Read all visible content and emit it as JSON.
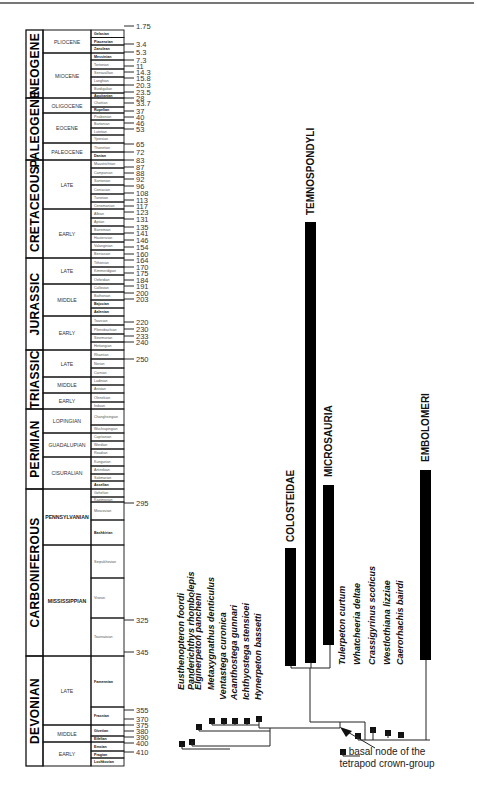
{
  "figure": {
    "timescale": {
      "systems": [
        {
          "name": "NEOGENE",
          "series": [
            {
              "name": "PLIOCENE",
              "stages": [
                "Gelasian",
                "Piacenzian",
                "Zanclean"
              ]
            },
            {
              "name": "MIOCENE",
              "stages": [
                "Messinian",
                "Tortonian",
                "Serravallian",
                "Langhian",
                "Burdigalian",
                "Aquitanian"
              ]
            }
          ]
        },
        {
          "name": "PALEOGENE",
          "series": [
            {
              "name": "OLIGOCENE",
              "stages": [
                "Chattian",
                "Rupelian"
              ]
            },
            {
              "name": "EOCENE",
              "stages": [
                "Priabonian",
                "Bartonian",
                "Lutetian",
                "Ypresian"
              ]
            },
            {
              "name": "PALEOCENE",
              "stages": [
                "Thanetian",
                "Danian"
              ]
            }
          ]
        },
        {
          "name": "CRETACEOUS",
          "series": [
            {
              "name": "LATE",
              "stages": [
                "Maastrichtian",
                "Campanian",
                "Santonian",
                "Coniacian",
                "Turonian",
                "Cenomanian"
              ]
            },
            {
              "name": "EARLY",
              "stages": [
                "Albian",
                "Aptian",
                "Barremian",
                "Hauterivian",
                "Valanginian",
                "Berriasian"
              ]
            }
          ]
        },
        {
          "name": "JURASSIC",
          "series": [
            {
              "name": "LATE",
              "stages": [
                "Tithonian",
                "Kimmeridgian",
                "Oxfordian"
              ]
            },
            {
              "name": "MIDDLE",
              "stages": [
                "Callovian",
                "Bathonian",
                "Bajocian",
                "Aalenian"
              ]
            },
            {
              "name": "EARLY",
              "stages": [
                "Toarcian",
                "Pliensbachian",
                "Sinemurian",
                "Hettangian"
              ]
            }
          ]
        },
        {
          "name": "TRIASSIC",
          "series": [
            {
              "name": "LATE",
              "stages": [
                "Rhaetian",
                "Norian",
                "Carnian"
              ]
            },
            {
              "name": "MIDDLE",
              "stages": [
                "Ladinian",
                "Anisian"
              ]
            },
            {
              "name": "EARLY",
              "stages": [
                "Olenekian",
                "Induan"
              ]
            }
          ]
        },
        {
          "name": "PERMIAN",
          "series": [
            {
              "name": "LOPINGIAN",
              "stages": [
                "Changhsingian",
                "Wuchiapingian"
              ]
            },
            {
              "name": "GUADALUPIAN",
              "stages": [
                "Capitanian",
                "Wordian",
                "Roadian"
              ]
            },
            {
              "name": "CISURALIAN",
              "stages": [
                "Kungurian",
                "Artinskian",
                "Sakmarian",
                "Asselian"
              ]
            }
          ]
        },
        {
          "name": "CARBONIFEROUS",
          "series": [
            {
              "name": "PENNSYLVANIAN",
              "stages": [
                "Gzhelian",
                "Kazimovian",
                "Moscovian",
                "Bashkirian"
              ]
            },
            {
              "name": "MISSISSIPPIAN",
              "stages": [
                "Serpukhovian",
                "Visean",
                "Tournaisian"
              ]
            }
          ]
        },
        {
          "name": "DEVONIAN",
          "series": [
            {
              "name": "LATE",
              "stages": [
                "Famennian",
                "Frasnian"
              ]
            },
            {
              "name": "MIDDLE",
              "stages": [
                "Givetian",
                "Eifelian"
              ]
            },
            {
              "name": "EARLY",
              "stages": [
                "Emsian",
                "Pragian",
                "Lochkovian"
              ]
            }
          ]
        }
      ],
      "ages_ma": [
        "1.75",
        "3.4",
        "5.3",
        "7.3",
        "11",
        "14.3",
        "15.8",
        "20.3",
        "23.5",
        "28",
        "33.7",
        "37",
        "40",
        "46",
        "53",
        "65",
        "72",
        "83",
        "87",
        "88",
        "92",
        "96",
        "108",
        "113",
        "117",
        "123",
        "131",
        "135",
        "141",
        "146",
        "154",
        "160",
        "164",
        "170",
        "175",
        "184",
        "191",
        "200",
        "203",
        "220",
        "230",
        "233",
        "240",
        "250",
        "295",
        "325",
        "345",
        "355",
        "370",
        "375",
        "380",
        "390",
        "400",
        "410"
      ]
    },
    "cladogram": {
      "taxa": [
        "Eusthenopteron foordi",
        "Panderichthys rhombolepis",
        "Elginerpeton pancheni",
        "Metaxygnathus denticulus",
        "Ventastega curonica",
        "Acanthostega gunnari",
        "Ichthyostega stensioei",
        "Hynerpeton bassetti",
        "Tulerpeton curtum",
        "Whatcheeria deltae",
        "Crassigyrinus scoticus",
        "Westlothiana lizziae",
        "Caerorhachis bairdi"
      ],
      "clades": [
        "COLOSTEIDAE",
        "TEMNOSPONDYLI",
        "MICROSAURIA",
        "EMBOLOMERI"
      ],
      "annotation": {
        "line1": "basal node of the",
        "line2": "tetrapod crown-group"
      }
    }
  }
}
